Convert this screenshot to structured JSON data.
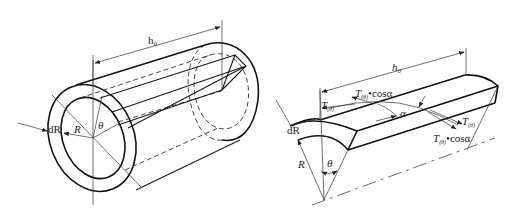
{
  "figure": {
    "left_panel": {
      "name": "thick-walled cylinder",
      "labels": {
        "length": "h₀",
        "thickness": "dR",
        "radius": "R",
        "angle": "θ"
      }
    },
    "right_panel": {
      "name": "wedge element",
      "labels": {
        "length": "h₀",
        "tension_left": "T",
        "tension_left_sub": "(θ)",
        "tension_left_cos": "T",
        "tension_left_cos_sub": "(θ)",
        "tension_left_cos_suffix": "•cosα",
        "angle_alpha": "α",
        "tension_right": "T",
        "tension_right_sub": "(θ)",
        "tension_right_cos": "T",
        "tension_right_cos_sub": "(θ)",
        "tension_right_cos_suffix": "•cosα",
        "thickness": "dR",
        "radius": "R",
        "angle": "θ"
      }
    }
  }
}
